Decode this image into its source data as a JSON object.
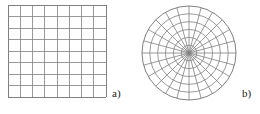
{
  "figure": {
    "background_color": "#ffffff",
    "width": 260,
    "height": 114,
    "panels": [
      {
        "id": "a",
        "label": "a)",
        "mesh_type": "cartesian-grid",
        "description": "Structured quadrilateral mesh on a square domain"
      },
      {
        "id": "b",
        "label": "b)",
        "mesh_type": "polar-grid",
        "description": "Structured polar mesh on a circular domain"
      }
    ]
  },
  "chart_data": {
    "type": "diagram",
    "title": "",
    "meshes": [
      {
        "panel": "a",
        "label": "a)",
        "kind": "cartesian",
        "columns": 8,
        "rows": 8,
        "x_range": [
          8,
          106
        ],
        "y_range": [
          5,
          97
        ],
        "cell_width": 12.25,
        "cell_height": 11.5,
        "line_color": "#808080",
        "border_color": "#808080",
        "line_width": 0.8,
        "border_width": 1.0
      },
      {
        "panel": "b",
        "label": "b)",
        "kind": "polar",
        "center": [
          59,
          53
        ],
        "outer_radius": 47,
        "radial_divisions": 6,
        "angular_divisions": 24,
        "ring_radii": [
          7.8,
          15.7,
          23.5,
          31.3,
          39.2,
          47
        ],
        "spoke_angles_deg": [
          0,
          15,
          30,
          45,
          60,
          75,
          90,
          105,
          120,
          135,
          150,
          165,
          180,
          195,
          210,
          225,
          240,
          255,
          270,
          285,
          300,
          315,
          330,
          345
        ],
        "line_color": "#808080",
        "border_color": "#808080",
        "line_width": 0.8,
        "border_width": 1.0
      }
    ],
    "labels": [
      "a)",
      "b)"
    ],
    "xlabel": "",
    "ylabel": "",
    "legend": []
  },
  "colors": {
    "mesh_line": "#808080",
    "mesh_border": "#808080",
    "label_text": "#1a1a1a",
    "background": "#ffffff"
  }
}
